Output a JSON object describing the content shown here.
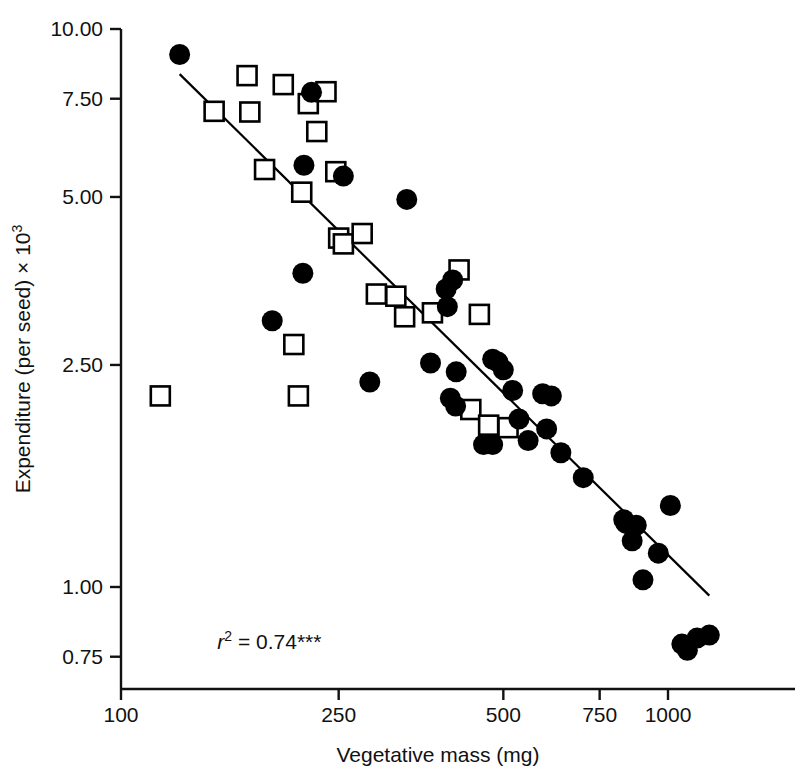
{
  "chart_data": {
    "type": "scatter",
    "title": "",
    "xlabel": "Vegetative mass (mg)",
    "ylabel": "Expenditure (per seed) × 10³",
    "xscale": "log",
    "yscale": "log",
    "xlim": [
      100,
      1300
    ],
    "ylim": [
      0.7,
      10.0
    ],
    "xticks": [
      100,
      250,
      500,
      750,
      1000
    ],
    "xtick_labels": [
      "100",
      "250",
      "500",
      "750",
      "1000"
    ],
    "yticks": [
      10.0,
      7.5,
      5.0,
      2.5,
      1.0,
      0.75
    ],
    "ytick_labels": [
      "10.00",
      "7.50",
      "5.00",
      "2.50",
      "1.00",
      "0.75"
    ],
    "grid": false,
    "legend": "none",
    "annotations": [
      {
        "name": "r-squared-annotation",
        "text": "r2 = 0.74***",
        "r_label": "r",
        "r_exponent": "2",
        "equals": " = ",
        "value": "0.74",
        "significance": "***",
        "x": 150,
        "y": 0.775
      }
    ],
    "series": [
      {
        "name": "filled-circles",
        "marker": "filled-circle",
        "color": "#000000",
        "points": [
          [
            128,
            9.0
          ],
          [
            223,
            7.7
          ],
          [
            216,
            5.7
          ],
          [
            255,
            5.45
          ],
          [
            333,
            4.95
          ],
          [
            215,
            3.65
          ],
          [
            189,
            3.0
          ],
          [
            404,
            3.55
          ],
          [
            393,
            3.42
          ],
          [
            395,
            3.18
          ],
          [
            285,
            2.33
          ],
          [
            368,
            2.52
          ],
          [
            410,
            2.43
          ],
          [
            409,
            2.11
          ],
          [
            400,
            2.18
          ],
          [
            478,
            2.56
          ],
          [
            489,
            2.53
          ],
          [
            500,
            2.45
          ],
          [
            520,
            2.25
          ],
          [
            460,
            1.8
          ],
          [
            478,
            1.8
          ],
          [
            534,
            2.0
          ],
          [
            555,
            1.83
          ],
          [
            590,
            2.22
          ],
          [
            612,
            2.2
          ],
          [
            600,
            1.92
          ],
          [
            637,
            1.74
          ],
          [
            700,
            1.57
          ],
          [
            830,
            1.32
          ],
          [
            838,
            1.3
          ],
          [
            875,
            1.29
          ],
          [
            860,
            1.21
          ],
          [
            960,
            1.15
          ],
          [
            900,
            1.03
          ],
          [
            1010,
            1.4
          ],
          [
            1060,
            0.79
          ],
          [
            1085,
            0.77
          ],
          [
            1130,
            0.81
          ],
          [
            1190,
            0.82
          ]
        ]
      },
      {
        "name": "open-squares",
        "marker": "open-square",
        "color": "#000000",
        "points": [
          [
            148,
            7.12
          ],
          [
            170,
            8.25
          ],
          [
            172,
            7.1
          ],
          [
            198,
            7.95
          ],
          [
            220,
            7.35
          ],
          [
            237,
            7.72
          ],
          [
            228,
            6.55
          ],
          [
            214,
            5.1
          ],
          [
            183,
            5.6
          ],
          [
            247,
            5.55
          ],
          [
            250,
            4.22
          ],
          [
            255,
            4.12
          ],
          [
            276,
            4.3
          ],
          [
            118,
            2.2
          ],
          [
            207,
            2.72
          ],
          [
            211,
            2.2
          ],
          [
            293,
            3.35
          ],
          [
            318,
            3.32
          ],
          [
            330,
            3.05
          ],
          [
            371,
            3.1
          ],
          [
            415,
            3.7
          ],
          [
            452,
            3.08
          ],
          [
            436,
            2.08
          ],
          [
            470,
            1.95
          ],
          [
            510,
            1.93
          ]
        ]
      }
    ],
    "fit_line": {
      "name": "regression-line",
      "x_start": 128,
      "y_start": 8.3,
      "x_end": 1190,
      "y_end": 0.965,
      "color": "#000000",
      "width": 2.2
    }
  }
}
